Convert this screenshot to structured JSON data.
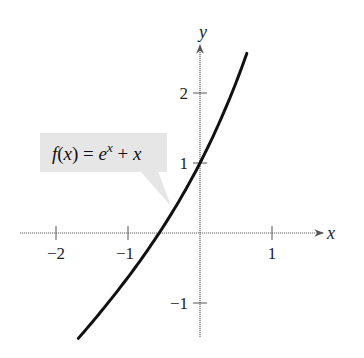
{
  "chart_data": {
    "type": "line",
    "title": "",
    "function": "f(x) = e^x + x",
    "xlabel": "x",
    "ylabel": "y",
    "xlim": [
      -2.5,
      1.7
    ],
    "ylim": [
      -1.5,
      2.7
    ],
    "x_ticks": [
      -2,
      -1,
      1
    ],
    "x_tick_labels": [
      "−2",
      "−1",
      "1"
    ],
    "y_ticks": [
      -1,
      1,
      2
    ],
    "y_tick_labels": [
      "−1",
      "1",
      "2"
    ],
    "grid": false,
    "legend": null,
    "annotations": [
      {
        "text_parts": [
          "f(x) = e",
          "x",
          " + x"
        ],
        "points_to": [
          -0.45,
          0.19
        ]
      }
    ],
    "series": [
      {
        "name": "f(x) = e^x + x",
        "x": [
          -1.69,
          -1.5,
          -1.25,
          -1.0,
          -0.75,
          -0.5,
          -0.25,
          0.0,
          0.25,
          0.5,
          0.65
        ],
        "values": [
          -1.5,
          -1.28,
          -0.96,
          -0.63,
          -0.28,
          0.11,
          0.53,
          1.0,
          1.53,
          2.15,
          2.57
        ]
      }
    ],
    "colors": {
      "curve": "#111111",
      "axes": "#555555",
      "callout_fill": "#e6e6e6"
    }
  },
  "labels": {
    "x_axis": "x",
    "y_axis": "y",
    "callout_main": "f(x) = e",
    "callout_sup": "x",
    "callout_tail": " + x",
    "xtick_m2": "−2",
    "xtick_m1": "−1",
    "xtick_1": "1",
    "ytick_2": "2",
    "ytick_1": "1",
    "ytick_m1": "−1"
  }
}
